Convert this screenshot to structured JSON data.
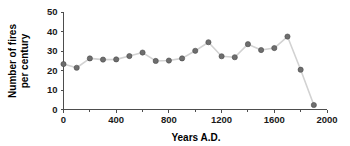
{
  "chart_data": {
    "type": "line",
    "title": "",
    "subtitle": "",
    "xlabel": "Years A.D.",
    "ylabel": "Number of fires per century",
    "ylabel_line1": "Number of fires",
    "ylabel_line2": "per century",
    "xlim": [
      0,
      2000
    ],
    "ylim": [
      0,
      50
    ],
    "xticks": [
      0,
      400,
      800,
      1200,
      1600,
      2000
    ],
    "xtick_labels": [
      "0",
      "400",
      "800",
      "1200",
      "1600",
      "2000"
    ],
    "xminorticks": [
      200,
      600,
      1000,
      1400,
      1800
    ],
    "yticks": [
      0,
      10,
      20,
      30,
      40,
      50
    ],
    "ytick_labels": [
      "0",
      "10",
      "20",
      "30",
      "40",
      "50"
    ],
    "grid": false,
    "legend": false,
    "legend_position": "none",
    "marker": "circle",
    "marker_color": "#6e6e6e",
    "line_color": "#d2d2d2",
    "x": [
      0,
      100,
      200,
      300,
      400,
      500,
      600,
      700,
      800,
      900,
      1000,
      1100,
      1200,
      1300,
      1400,
      1500,
      1600,
      1700,
      1800,
      1900
    ],
    "values": [
      23.3,
      21.4,
      26.2,
      25.6,
      25.7,
      27.4,
      29.2,
      24.9,
      25.1,
      26.2,
      30.1,
      34.5,
      27.3,
      26.8,
      33.5,
      30.5,
      31.5,
      37.4,
      20.4,
      2.3
    ],
    "points": [
      {
        "x": 0,
        "y": 23.3
      },
      {
        "x": 100,
        "y": 21.4
      },
      {
        "x": 200,
        "y": 26.2
      },
      {
        "x": 300,
        "y": 25.6
      },
      {
        "x": 400,
        "y": 25.7
      },
      {
        "x": 500,
        "y": 27.4
      },
      {
        "x": 600,
        "y": 29.2
      },
      {
        "x": 700,
        "y": 24.9
      },
      {
        "x": 800,
        "y": 25.1
      },
      {
        "x": 900,
        "y": 26.2
      },
      {
        "x": 1000,
        "y": 30.1
      },
      {
        "x": 1100,
        "y": 34.5
      },
      {
        "x": 1200,
        "y": 27.3
      },
      {
        "x": 1300,
        "y": 26.8
      },
      {
        "x": 1400,
        "y": 33.5
      },
      {
        "x": 1500,
        "y": 30.5
      },
      {
        "x": 1600,
        "y": 31.5
      },
      {
        "x": 1700,
        "y": 37.4
      },
      {
        "x": 1800,
        "y": 20.4
      },
      {
        "x": 1900,
        "y": 2.3
      }
    ]
  }
}
